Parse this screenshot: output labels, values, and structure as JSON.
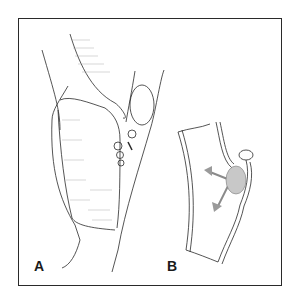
{
  "figure": {
    "panels": [
      {
        "label": "A",
        "description": "Vessel bifurcation with patch graft and sutures"
      },
      {
        "label": "B",
        "description": "Opened vessel segment with arrows indicating direction"
      }
    ]
  },
  "colors": {
    "line": "#2a2a2a",
    "shade": "#9a9a9a",
    "arrow": "#8a8a8a"
  }
}
